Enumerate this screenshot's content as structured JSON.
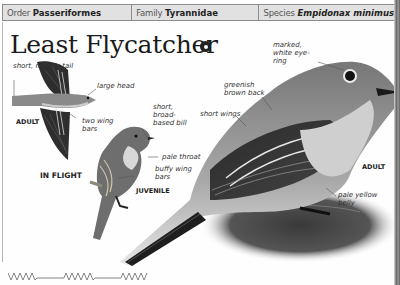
{
  "header": {
    "order_label": "Order",
    "order_value": "Passeriformes",
    "family_label": "Family",
    "family_value": "Tyrannidae",
    "species_label": "Species",
    "species_value": "Empidonax minimus"
  },
  "title": "Least Flycatcher",
  "audio_icon": "audio-play-icon",
  "in_flight": {
    "caption": "IN FLIGHT",
    "age_tag": "ADULT",
    "annotations": {
      "tail": "short, narrow tail",
      "head": "large head",
      "wingbars": "two wing bars"
    }
  },
  "juvenile": {
    "caption": "JUVENILE",
    "annotations": {
      "bill": "short, broad-based bill",
      "throat": "pale throat",
      "wingbars": "buffy wing bars"
    }
  },
  "adult": {
    "caption": "ADULT",
    "annotations": {
      "eye_ring": "marked, white eye-ring",
      "back": "greenish brown back",
      "wings": "short wings",
      "belly": "pale yellow belly"
    }
  },
  "song_graphic": "song-pattern-icon",
  "colors": {
    "header_bg": "#e1e1e1",
    "header_border": "#8c8c8c",
    "text": "#1a1a1a"
  }
}
